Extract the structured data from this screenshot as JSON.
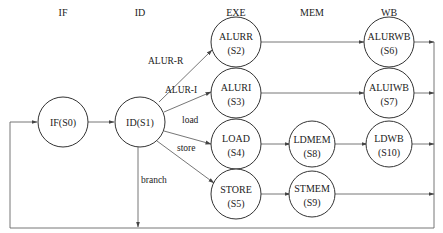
{
  "stages": [
    {
      "label": "IF",
      "x": 63
    },
    {
      "label": "ID",
      "x": 140
    },
    {
      "label": "EXE",
      "x": 236
    },
    {
      "label": "MEM",
      "x": 312
    },
    {
      "label": "WB",
      "x": 389
    }
  ],
  "nodes": {
    "s0": {
      "line1": "IF(S0)",
      "line2": ""
    },
    "s1": {
      "line1": "ID(S1)",
      "line2": ""
    },
    "s2": {
      "line1": "ALURR",
      "line2": "(S2)"
    },
    "s3": {
      "line1": "ALURI",
      "line2": "(S3)"
    },
    "s4": {
      "line1": "LOAD",
      "line2": "(S4)"
    },
    "s5": {
      "line1": "STORE",
      "line2": "(S5)"
    },
    "s6": {
      "line1": "ALURWB",
      "line2": "(S6)"
    },
    "s7": {
      "line1": "ALUIWB",
      "line2": "(S7)"
    },
    "s8": {
      "line1": "LDMEM",
      "line2": "(S8)"
    },
    "s9": {
      "line1": "STMEM",
      "line2": "(S9)"
    },
    "s10": {
      "line1": "LDWB",
      "line2": "(S10)"
    }
  },
  "edge_labels": {
    "alur_r": "ALUR-R",
    "alur_i": "ALUR-I",
    "load": "load",
    "store": "store",
    "branch": "branch"
  },
  "colors": {
    "stroke": "#333333",
    "edge": "#666666"
  }
}
